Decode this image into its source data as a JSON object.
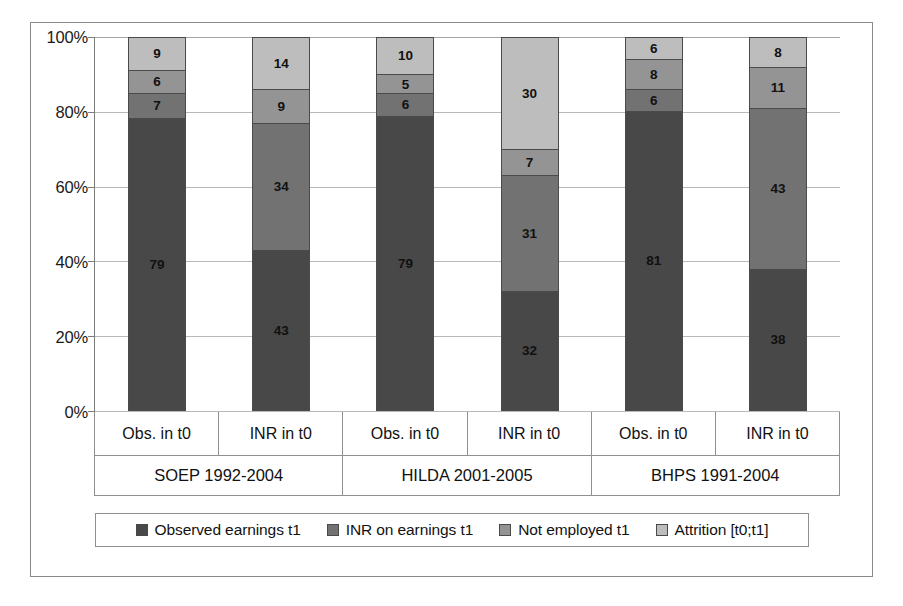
{
  "chart_data": {
    "type": "bar",
    "subtype": "stacked-100-percent",
    "title": "",
    "xlabel": "",
    "ylabel": "",
    "ylim": [
      0,
      100
    ],
    "ytick_labels": [
      "0%",
      "20%",
      "40%",
      "60%",
      "80%",
      "100%"
    ],
    "ytick_values": [
      0,
      20,
      40,
      60,
      80,
      100
    ],
    "grid": true,
    "legend_position": "bottom",
    "categories": [
      "Obs. in t0",
      "INR in t0",
      "Obs. in t0",
      "INR in t0",
      "Obs. in t0",
      "INR in t0"
    ],
    "groups": [
      {
        "label": "SOEP 1992-2004",
        "span": 2
      },
      {
        "label": "HILDA 2001-2005",
        "span": 2
      },
      {
        "label": "BHPS 1991-2004",
        "span": 2
      }
    ],
    "series": [
      {
        "name": "Observed earnings t1",
        "color": "#484848",
        "values": [
          79,
          43,
          79,
          32,
          81,
          38
        ]
      },
      {
        "name": "INR on earnings t1",
        "color": "#727272",
        "values": [
          7,
          34,
          6,
          31,
          6,
          43
        ]
      },
      {
        "name": "Not employed t1",
        "color": "#949494",
        "values": [
          6,
          9,
          5,
          7,
          8,
          11
        ]
      },
      {
        "name": "Attrition [t0;t1]",
        "color": "#bdbdbd",
        "values": [
          9,
          14,
          10,
          30,
          6,
          8
        ]
      }
    ],
    "bars": [
      {
        "category": "Obs. in t0",
        "group": "SOEP 1992-2004",
        "segments": [
          79,
          7,
          6,
          9
        ]
      },
      {
        "category": "INR in t0",
        "group": "SOEP 1992-2004",
        "segments": [
          43,
          34,
          9,
          14
        ]
      },
      {
        "category": "Obs. in t0",
        "group": "HILDA 2001-2005",
        "segments": [
          79,
          6,
          5,
          10
        ]
      },
      {
        "category": "INR in t0",
        "group": "HILDA 2001-2005",
        "segments": [
          32,
          31,
          7,
          30
        ]
      },
      {
        "category": "Obs. in t0",
        "group": "BHPS 1991-2004",
        "segments": [
          81,
          6,
          8,
          6
        ]
      },
      {
        "category": "INR in t0",
        "group": "BHPS 1991-2004",
        "segments": [
          38,
          43,
          11,
          8
        ]
      }
    ]
  },
  "colors": {
    "observed_earnings": "#484848",
    "inr_on_earnings": "#727272",
    "not_employed": "#949494",
    "attrition": "#bdbdbd",
    "frame": "#8a8a8a",
    "grid": "#b9b9b9",
    "axis": "#7d7d7d",
    "text": "#111111"
  },
  "legend": {
    "items": [
      {
        "label": "Observed earnings t1",
        "color": "#484848",
        "swatch": "square-swatch"
      },
      {
        "label": "INR on earnings t1",
        "color": "#727272",
        "swatch": "square-swatch"
      },
      {
        "label": "Not employed t1",
        "color": "#949494",
        "swatch": "square-swatch"
      },
      {
        "label": "Attrition [t0;t1]",
        "color": "#bdbdbd",
        "swatch": "square-swatch"
      }
    ]
  }
}
